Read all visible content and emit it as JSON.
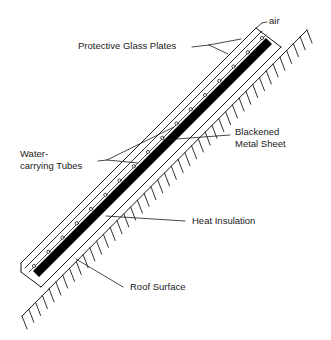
{
  "diagram": {
    "labels": {
      "air": "air",
      "glass": "Protective Glass Plates",
      "black_sheet_1": "Blackened",
      "black_sheet_2": "Metal Sheet",
      "tubes_1": "Water-",
      "tubes_2": "carrying Tubes",
      "insulation": "Heat Insulation",
      "roof": "Roof Surface"
    },
    "colors": {
      "line": "#1a1a1a",
      "metal_sheet": "#000000",
      "background": "#ffffff"
    }
  }
}
